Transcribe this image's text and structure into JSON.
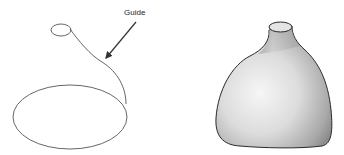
{
  "diagram": {
    "left_panel": {
      "description": "wireframe sweep profiles",
      "annotation": {
        "label": "Guide",
        "target": "guide-curve"
      },
      "stroke_color": "#555555"
    },
    "right_panel": {
      "description": "shaded lofted vase solid",
      "shade_light": "#f4f4f4",
      "shade_dark": "#7a7a7a",
      "outline_color": "#2a2a2a"
    }
  }
}
